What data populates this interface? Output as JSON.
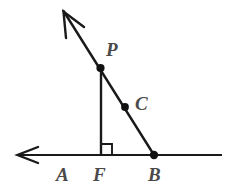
{
  "diagram": {
    "background_color": "#ffffff",
    "stroke_color": "#1a1a1a",
    "label_color": "#4a4a4a",
    "labels": {
      "P": "P",
      "C": "C",
      "A": "A",
      "F": "F",
      "B": "B"
    },
    "points": [
      {
        "name": "P",
        "x": 100,
        "y": 68,
        "dotted": true
      },
      {
        "name": "C",
        "x": 125,
        "y": 107,
        "dotted": true
      },
      {
        "name": "B",
        "x": 154,
        "y": 155,
        "dotted": true
      },
      {
        "name": "F",
        "x": 101,
        "y": 155,
        "dotted": false
      },
      {
        "name": "A",
        "x": 62,
        "y": 155,
        "dotted": false
      }
    ],
    "segments": [
      {
        "name": "horizontal-line-AB",
        "x1": 17,
        "y1": 155,
        "x2": 222,
        "y2": 155
      },
      {
        "name": "vertical-segment-PF",
        "x1": 101,
        "y1": 68,
        "x2": 101,
        "y2": 155
      },
      {
        "name": "ray-through-P-C-B",
        "x1": 63,
        "y1": 10,
        "x2": 154,
        "y2": 155
      }
    ],
    "arrows": [
      {
        "name": "left-arrowhead",
        "tip_x": 17,
        "tip_y": 155,
        "direction": "left"
      },
      {
        "name": "up-left-arrowhead",
        "tip_x": 63,
        "tip_y": 10,
        "direction": "up-left"
      }
    ],
    "right_angle_marker": {
      "name": "right-angle-at-F",
      "vertex_x": 101,
      "vertex_y": 155,
      "size": 11,
      "opens": "up-right"
    }
  }
}
